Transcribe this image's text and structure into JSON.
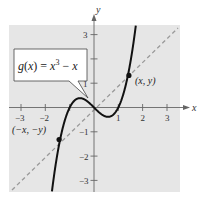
{
  "chart_data": {
    "type": "line",
    "title": "",
    "xlabel": "x",
    "ylabel": "y",
    "xlim": [
      -3.5,
      3.5
    ],
    "ylim": [
      -3.5,
      3.5
    ],
    "grid": false,
    "x_ticks": [
      -3,
      -2,
      -1,
      1,
      2,
      3
    ],
    "x_tick_labels": [
      "-3",
      "-2",
      "",
      "1",
      "2",
      "3"
    ],
    "y_ticks": [
      -3,
      -2,
      -1,
      1,
      2,
      3
    ],
    "y_tick_labels": [
      "−3",
      "−2",
      "−1",
      "1",
      "",
      "3"
    ],
    "series": [
      {
        "name": "g(x) = x^3 - x",
        "style": "solid",
        "function": "x^3 - x",
        "x": [
          -1.8,
          -1.5,
          -1.25,
          -1.0,
          -0.75,
          -0.577,
          -0.25,
          0,
          0.25,
          0.577,
          0.75,
          1.0,
          1.25,
          1.5,
          1.8
        ],
        "values": [
          -4.03,
          -1.88,
          -0.7,
          0,
          0.33,
          0.385,
          0.23,
          0,
          -0.23,
          -0.385,
          -0.33,
          0,
          0.7,
          1.88,
          4.03
        ]
      },
      {
        "name": "y = x",
        "style": "dashed",
        "function": "x",
        "x": [
          -3.4,
          3.4
        ],
        "values": [
          -3.4,
          3.4
        ]
      }
    ],
    "points": [
      {
        "label": "(x, y)",
        "x": 1.4,
        "y": 1.34
      },
      {
        "label": "(−x, −y)",
        "x": -1.4,
        "y": -1.34
      }
    ],
    "annotations": [
      {
        "text": "g(x) = x³ − x",
        "type": "callout",
        "points_to": [
          -0.25,
          0.3
        ]
      }
    ]
  },
  "labels": {
    "x_axis": "x",
    "y_axis": "y",
    "equation_g": "g",
    "equation_paren": "(x) = x",
    "equation_exp": "3",
    "equation_tail": " − x",
    "point_pos": "(x, y)",
    "point_neg": "(−x, −y)"
  },
  "colors": {
    "plot_bg": "#e6e6e6",
    "curve": "#111111",
    "dashed": "#9a9a9a",
    "axis": "#555555",
    "callout_bg": "#ffffff"
  }
}
